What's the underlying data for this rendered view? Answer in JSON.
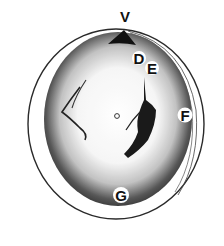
{
  "figure": {
    "labels": [
      {
        "id": "V",
        "text": "V",
        "x": 125,
        "y": 22
      },
      {
        "id": "D",
        "text": "D",
        "x": 139,
        "y": 64
      },
      {
        "id": "E",
        "text": "E",
        "x": 152,
        "y": 74
      },
      {
        "id": "F",
        "text": "F",
        "x": 185,
        "y": 121
      },
      {
        "id": "G",
        "text": "G",
        "x": 121,
        "y": 201
      }
    ],
    "colors": {
      "ink": "#1a1a1a",
      "shade": "#3a3a3a",
      "paper": "#ffffff"
    }
  }
}
